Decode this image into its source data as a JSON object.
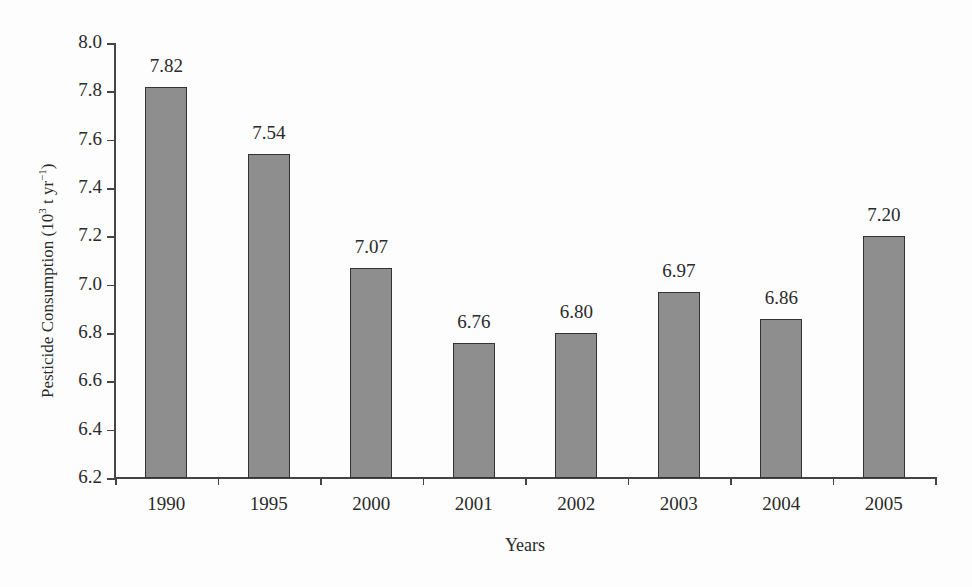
{
  "chart_data": {
    "type": "bar",
    "title": "",
    "xlabel": "Years",
    "ylabel": "Pesticide Consumption (10³ t yr⁻¹)",
    "ylabel_parts": {
      "main": "Pesticide Consumption (10",
      "sup1": "3",
      "mid": " t yr",
      "sup2": "−1",
      "end": ")"
    },
    "categories": [
      "1990",
      "1995",
      "2000",
      "2001",
      "2002",
      "2003",
      "2004",
      "2005"
    ],
    "values": [
      7.82,
      7.54,
      7.07,
      6.76,
      6.8,
      6.97,
      6.86,
      7.2
    ],
    "value_labels": [
      "7.82",
      "7.54",
      "7.07",
      "6.76",
      "6.80",
      "6.97",
      "6.86",
      "7.20"
    ],
    "ylim": [
      6.2,
      8.0
    ],
    "yticks": [
      "6.2",
      "6.4",
      "6.6",
      "6.8",
      "7.0",
      "7.2",
      "7.4",
      "7.6",
      "7.8",
      "8.0"
    ],
    "grid": false,
    "legend": null,
    "colors": {
      "bar_fill": "#8e8e8e",
      "bar_border": "#333333",
      "axis": "#444444"
    }
  }
}
